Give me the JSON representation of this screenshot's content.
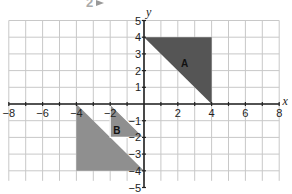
{
  "header": {
    "question_number": "2",
    "arrow_icon": "arrow-right-icon"
  },
  "chart_data": {
    "type": "coordinate-grid",
    "title": "",
    "xlabel": "x",
    "ylabel": "y",
    "xlim": [
      -8,
      8
    ],
    "ylim": [
      -5,
      5
    ],
    "grid": true,
    "x_tick_labels": [
      "-8",
      "-6",
      "-4",
      "-2",
      "2",
      "4",
      "6",
      "8"
    ],
    "y_tick_labels": [
      "5",
      "4",
      "3",
      "2",
      "1",
      "-1",
      "-2",
      "-3",
      "-4",
      "-5"
    ],
    "shapes": [
      {
        "label": "A",
        "color": "#555555",
        "vertices": [
          [
            0,
            4
          ],
          [
            4,
            4
          ],
          [
            4,
            0
          ]
        ]
      },
      {
        "label": "B",
        "color": "#8f8f8f",
        "vertices": [
          [
            -4,
            0
          ],
          [
            -4,
            -4
          ],
          [
            0,
            -4
          ]
        ],
        "extra_piece": [
          [
            -2,
            0
          ],
          [
            -2,
            -2
          ],
          [
            0,
            -2
          ]
        ]
      }
    ]
  },
  "colors": {
    "grid": "#c8c8c8",
    "axis": "#222222",
    "shape_a": "#555555",
    "shape_b": "#8f8f8f"
  }
}
